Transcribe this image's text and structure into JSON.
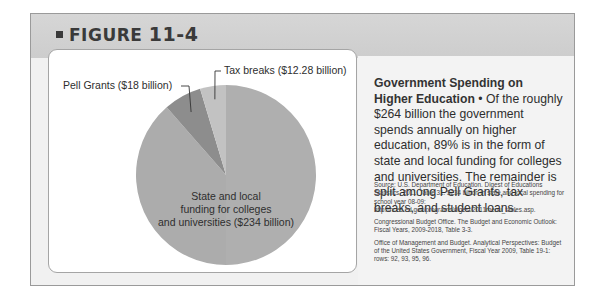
{
  "figure": {
    "label": "FIGURE",
    "number": "11-4"
  },
  "caption": {
    "title": "Government Spending on Higher Education",
    "bullet": "•",
    "body": "Of the roughly $264 billion the government spends annually on higher education, 89% is in the form of state and local funding for colleges and universities. The remainder is split among Pell Grants, tax breaks, and student loans."
  },
  "sources": [
    "Source: U.S. Department of Education. Digest of Educations Statistics, 2011, Table 31. $234 billion in state and local spending for school year 08-09: http://nces.ed.gov/programs/digest/2011menu_tables.asp.",
    "Congressional Budget Office. The Budget and Economic Outlook: Fiscal Years, 2009-2018, Table 3-3.",
    "Office of Management and Budget. Analytical Perspectives: Budget of the United States Government, Fiscal Year 2009, Table 19-1: rows: 92, 93, 95, 96."
  ],
  "chart_data": {
    "type": "pie",
    "title": "Government Spending on Higher Education",
    "units": "billion USD",
    "slices": [
      {
        "name": "State and local funding for colleges and universities",
        "value": 234,
        "label_lines": [
          "State and local",
          "funding for colleges",
          "and universities ($234 billion)"
        ],
        "color": "#acacac"
      },
      {
        "name": "Pell Grants",
        "value": 18,
        "label_lines": [
          "Pell Grants ($18 billion)"
        ],
        "color": "#8d8d8d"
      },
      {
        "name": "Tax breaks",
        "value": 12.28,
        "label_lines": [
          "Tax breaks ($12.28 billion)"
        ],
        "color": "#c2c2c2"
      }
    ],
    "start": "top",
    "direction": "clockwise from top: State and local, then Pell Grants, then Tax breaks (ending at top)",
    "legend": "none (direct labels)"
  }
}
